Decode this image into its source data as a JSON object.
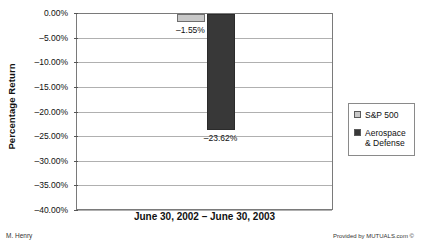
{
  "chart_data": {
    "type": "bar",
    "title": "",
    "xlabel": "June 30, 2002 – June 30, 2003",
    "ylabel": "Percentage Return",
    "categories": [
      "June 30, 2002 – June 30, 2003"
    ],
    "series": [
      {
        "name": "S&P 500",
        "values": [
          -1.55
        ],
        "color": "#c8c8c8",
        "data_label": "–1.55%"
      },
      {
        "name": "Aerospace & Defense",
        "values": [
          -23.62
        ],
        "color": "#383838",
        "data_label": "–23.62%"
      }
    ],
    "ylim": [
      -40.0,
      0.0
    ],
    "ytick_values": [
      0.0,
      -5.0,
      -10.0,
      -15.0,
      -20.0,
      -25.0,
      -30.0,
      -35.0,
      -40.0
    ],
    "ytick_labels": [
      "0.00%",
      "–5.00%",
      "–10.00%",
      "–15.00%",
      "–20.00%",
      "–25.00%",
      "–30.00%",
      "–35.00%",
      "–40.00%"
    ],
    "grid": true,
    "legend_position": "right",
    "legend_entries": [
      "S&P 500",
      "Aerospace & Defense"
    ]
  },
  "legend": {
    "items": [
      {
        "label": "S&P 500",
        "swatch": "sp500"
      },
      {
        "label_line1": "Aerospace",
        "label_line2": "& Defense",
        "swatch": "aero"
      }
    ]
  },
  "footer": {
    "credit_left": "M. Henry",
    "credit_right": "Provided by MUTUALS.com ©"
  }
}
